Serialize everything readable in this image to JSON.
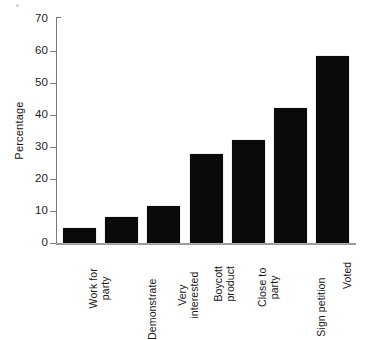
{
  "chart_data": {
    "type": "bar",
    "title": "",
    "subtitle": "",
    "xlabel": "",
    "ylabel": "Percentage",
    "ylim": [
      0,
      70
    ],
    "ytick_step": 10,
    "yticks": [
      0,
      10,
      20,
      30,
      40,
      50,
      60,
      70
    ],
    "ytick_labels": [
      "0",
      "10",
      "20",
      "30",
      "40",
      "50",
      "60",
      "70"
    ],
    "grid": false,
    "legend": null,
    "bar_color": "#0a0a0a",
    "background_color": "#ffffff",
    "axis_color": "#7a7a7a",
    "categories": [
      "Work for party",
      "Demonstrate",
      "Very interested",
      "Boycott product",
      "Close to party",
      "Sign petition",
      "Voted"
    ],
    "category_lines": [
      [
        "Work for",
        "party"
      ],
      [
        "Demonstrate",
        ""
      ],
      [
        "Very",
        "interested"
      ],
      [
        "Boycott",
        "product"
      ],
      [
        "Close to",
        "party"
      ],
      [
        "Sign petition",
        ""
      ],
      [
        "Voted",
        ""
      ]
    ],
    "values": [
      4.8,
      8.1,
      11.4,
      27.6,
      32.0,
      41.8,
      57.8
    ]
  }
}
